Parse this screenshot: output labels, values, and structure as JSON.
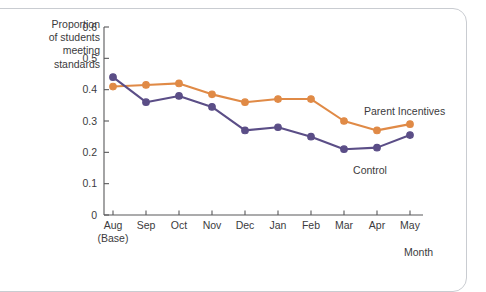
{
  "chart_data": {
    "type": "line",
    "title": "",
    "xlabel": "Month",
    "ylabel": "Proportion of students meeting standards",
    "categories": [
      "Aug",
      "Sep",
      "Oct",
      "Nov",
      "Dec",
      "Jan",
      "Feb",
      "Mar",
      "Apr",
      "May"
    ],
    "category_sublabels": [
      "(Base)",
      "",
      "",
      "",
      "",
      "",
      "",
      "",
      "",
      ""
    ],
    "ylim": [
      0,
      0.6
    ],
    "yticks": [
      0,
      0.1,
      0.2,
      0.3,
      0.4,
      0.5,
      0.6
    ],
    "ytick_labels": [
      "0",
      "0.1",
      "0.2",
      "0.3",
      "0.4",
      "0.5",
      "0.6"
    ],
    "grid": false,
    "legend_position": "inline-annotation",
    "series": [
      {
        "name": "Parent Incentives",
        "color": "#e08a46",
        "values": [
          0.41,
          0.415,
          0.42,
          0.385,
          0.36,
          0.37,
          0.37,
          0.3,
          0.27,
          0.29
        ]
      },
      {
        "name": "Control",
        "color": "#5b4e87",
        "values": [
          0.44,
          0.36,
          0.38,
          0.345,
          0.27,
          0.28,
          0.25,
          0.21,
          0.215,
          0.255
        ]
      }
    ],
    "annotations": [
      {
        "text": "Parent Incentives",
        "series": "Parent Incentives"
      },
      {
        "text": "Control",
        "series": "Control"
      }
    ]
  },
  "axis": {
    "y_label_lines": [
      "Proportion",
      "of students",
      "meeting",
      "standards"
    ],
    "x_title": "Month"
  },
  "colors": {
    "orange": "#e08a46",
    "purple": "#5b4e87",
    "axis": "#58585a",
    "text": "#3b3b3d",
    "frame": "#c9ccd1",
    "background": "#ffffff"
  }
}
